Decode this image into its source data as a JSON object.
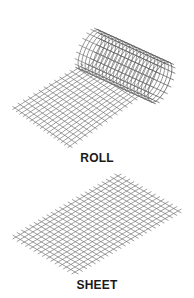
{
  "labels": {
    "roll": "ROLL",
    "sheet": "SHEET"
  },
  "colors": {
    "background": "#ffffff",
    "wire": "#777777",
    "wire_dark": "#555555",
    "text": "#1a1a1a"
  },
  "figures": {
    "roll": {
      "flat_mesh": {
        "corners": [
          [
            15,
            108
          ],
          [
            70,
            146
          ],
          [
            140,
            95
          ],
          [
            88,
            62
          ]
        ],
        "divisions_u": 14,
        "divisions_v": 16,
        "overhang": 3
      },
      "cylinder": {
        "start_center": [
          90,
          50
        ],
        "end_center": [
          160,
          82
        ],
        "radius": 22,
        "rings": 20,
        "longitudinal": 18,
        "overhang": 4
      }
    },
    "sheet": {
      "mesh": {
        "corners": [
          [
            16,
            237
          ],
          [
            75,
            272
          ],
          [
            178,
            211
          ],
          [
            118,
            176
          ]
        ],
        "divisions_u": 24,
        "divisions_v": 14,
        "overhang": 4
      }
    }
  }
}
